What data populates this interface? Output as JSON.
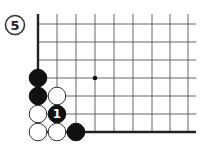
{
  "diagram": {
    "label": "5",
    "grid": {
      "x_lines": [
        38,
        57,
        76,
        95,
        114,
        133,
        152,
        170,
        188
      ],
      "y_lines": [
        24,
        42,
        60,
        78,
        96,
        114,
        132
      ],
      "x_end": 196,
      "y_start": 14,
      "line_color": "#555555",
      "edge_color": "#222222"
    },
    "star_points": [
      {
        "x": 95,
        "y": 78
      }
    ],
    "stones": [
      {
        "color": "black",
        "x": 38,
        "y": 78,
        "label": ""
      },
      {
        "color": "black",
        "x": 38,
        "y": 96,
        "label": ""
      },
      {
        "color": "white",
        "x": 57,
        "y": 96,
        "label": ""
      },
      {
        "color": "white",
        "x": 38,
        "y": 114,
        "label": ""
      },
      {
        "color": "black",
        "x": 57,
        "y": 114,
        "label": "1"
      },
      {
        "color": "white",
        "x": 38,
        "y": 132,
        "label": ""
      },
      {
        "color": "white",
        "x": 57,
        "y": 132,
        "label": ""
      },
      {
        "color": "black",
        "x": 76,
        "y": 132,
        "label": ""
      }
    ]
  }
}
